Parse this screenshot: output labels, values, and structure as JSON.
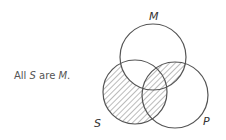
{
  "statement": {
    "prefix": "All ",
    "subject": "S",
    "middle": " are ",
    "predicate": "M",
    "suffix": "."
  },
  "diagram": {
    "type": "venn-three-circle",
    "circles": [
      {
        "id": "M",
        "label": "M"
      },
      {
        "id": "S",
        "label": "S"
      },
      {
        "id": "P",
        "label": "P"
      }
    ],
    "shaded_regions": [
      "S only",
      "S and P not M",
      "S and M and P",
      "M and P not S"
    ],
    "unshaded_regions": [
      "S and M not P",
      "M only",
      "P only"
    ],
    "colors": {
      "stroke": "#555555",
      "hatch": "#777777"
    }
  }
}
